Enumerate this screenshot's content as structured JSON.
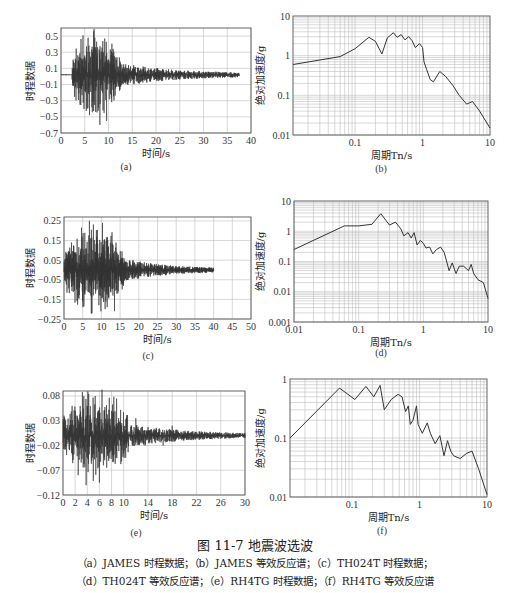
{
  "figure": {
    "title": "图 11-7   地震波选波",
    "caption_line1": "（a）JAMES 时程数据；（b）JAMES 等效反应谱；（c）TH024T 时程数据；",
    "caption_line2": "（d）TH024T 等效反应谱；（e）RH4TG 时程数据；（f）RH4TG 等效反应谱"
  },
  "chart_data": [
    {
      "id": "a",
      "panel_label": "(a)",
      "type": "line",
      "title": "JAMES 时程数据",
      "xlabel": "时间/s",
      "ylabel": "时程数据",
      "xlim": [
        0,
        40
      ],
      "ylim": [
        -0.7,
        0.6
      ],
      "xticks": [
        0,
        5,
        10,
        15,
        20,
        25,
        30,
        35,
        40
      ],
      "yticks": [
        0.5,
        0.3,
        0.1,
        -0.1,
        -0.3,
        -0.5,
        -0.7
      ],
      "grid": true,
      "signal": {
        "start": 2.3,
        "end": 37.5,
        "strong_end": 12.5,
        "peak_pos": 0.48,
        "peak_neg": -0.6,
        "baseline": 0.02
      },
      "series": [
        {
          "name": "JAMES",
          "x": [
            0,
            2.3,
            3,
            4,
            5,
            5.7,
            6.5,
            7.5,
            8.2,
            9.2,
            9.6,
            11,
            12.5,
            15.3,
            20,
            25,
            30,
            35,
            37.5
          ],
          "y": [
            0.02,
            0.02,
            0.22,
            -0.35,
            0.26,
            0.48,
            -0.38,
            0.43,
            -0.6,
            0.47,
            -0.55,
            0.25,
            0.16,
            0.14,
            0.06,
            0.05,
            0.05,
            0.03,
            0.02
          ]
        }
      ]
    },
    {
      "id": "b",
      "panel_label": "(b)",
      "type": "line",
      "title": "JAMES 等效反应谱",
      "xlabel": "周期Tn/s",
      "ylabel": "绝对加速度/g",
      "xscale": "log",
      "yscale": "log",
      "xlim": [
        0.012,
        10
      ],
      "ylim": [
        0.01,
        10
      ],
      "xticks": [
        0.1,
        1,
        10
      ],
      "yticks": [
        10,
        1,
        0.1,
        0.01
      ],
      "grid": true,
      "series": [
        {
          "name": "JAMES",
          "x": [
            0.012,
            0.06,
            0.1,
            0.16,
            0.2,
            0.25,
            0.3,
            0.37,
            0.42,
            0.48,
            0.55,
            0.62,
            0.7,
            0.78,
            0.9,
            1.0,
            1.05,
            1.15,
            1.3,
            1.45,
            1.8,
            2.2,
            2.8,
            3.5,
            4.5,
            5.5,
            7,
            10
          ],
          "y": [
            0.6,
            0.95,
            1.5,
            2.9,
            2.3,
            1.1,
            2.8,
            3.8,
            2.9,
            3.4,
            2.5,
            3.0,
            2.4,
            1.6,
            2.0,
            1.6,
            0.7,
            0.45,
            0.25,
            0.22,
            0.4,
            0.3,
            0.18,
            0.1,
            0.06,
            0.07,
            0.04,
            0.015
          ]
        }
      ]
    },
    {
      "id": "c",
      "panel_label": "(c)",
      "type": "line",
      "title": "TH024T 时程数据",
      "xlabel": "时间/s",
      "ylabel": "时程数据",
      "xlim": [
        0,
        50
      ],
      "ylim": [
        -0.25,
        0.27
      ],
      "xticks": [
        0,
        5,
        10,
        15,
        20,
        25,
        30,
        35,
        40,
        45,
        50
      ],
      "yticks": [
        0.25,
        0.15,
        0.05,
        -0.05,
        -0.15,
        -0.25
      ],
      "grid": true,
      "signal": {
        "start": 0,
        "end": 40,
        "strong_end": 16,
        "peak_pos": 0.25,
        "peak_neg": -0.22,
        "baseline": 0.0
      },
      "series": [
        {
          "name": "TH024T",
          "x": [
            0,
            2,
            4,
            6.8,
            7.5,
            10.3,
            11,
            13.5,
            15,
            18.5,
            20,
            25,
            30,
            35,
            40
          ],
          "y": [
            0.0,
            0.14,
            -0.12,
            0.25,
            -0.22,
            0.24,
            -0.2,
            -0.21,
            0.05,
            0.05,
            0.03,
            0.02,
            0.01,
            0.01,
            0.0
          ]
        }
      ]
    },
    {
      "id": "d",
      "panel_label": "(d)",
      "type": "line",
      "title": "TH024T 等效反应谱",
      "xlabel": "周期Tn/s",
      "ylabel": "绝对加速度/g",
      "xscale": "log",
      "yscale": "log",
      "xlim": [
        0.01,
        10
      ],
      "ylim": [
        0.001,
        10
      ],
      "xticks": [
        0.01,
        0.1,
        1,
        10
      ],
      "yticks": [
        10,
        1,
        0.1,
        0.01,
        0.001
      ],
      "grid": true,
      "series": [
        {
          "name": "TH024T",
          "x": [
            0.01,
            0.06,
            0.1,
            0.16,
            0.22,
            0.3,
            0.37,
            0.45,
            0.5,
            0.58,
            0.65,
            0.72,
            0.8,
            0.9,
            1.0,
            1.1,
            1.25,
            1.4,
            1.6,
            1.85,
            2.1,
            2.5,
            2.8,
            3.2,
            3.6,
            4.2,
            5.0,
            5.5,
            6.0,
            7,
            8.5,
            10
          ],
          "y": [
            0.25,
            1.5,
            1.5,
            1.7,
            3.8,
            1.6,
            2.0,
            1.2,
            0.7,
            0.9,
            0.6,
            0.9,
            0.35,
            0.5,
            0.4,
            0.28,
            0.3,
            0.18,
            0.25,
            0.3,
            0.2,
            0.05,
            0.09,
            0.04,
            0.07,
            0.07,
            0.05,
            0.08,
            0.04,
            0.025,
            0.02,
            0.006
          ]
        }
      ]
    },
    {
      "id": "e",
      "panel_label": "(e)",
      "type": "line",
      "title": "RH4TG 时程数据",
      "xlabel": "时间/s",
      "ylabel": "时程数据",
      "xlim": [
        0,
        30
      ],
      "ylim": [
        -0.12,
        0.09
      ],
      "xticks": [
        0,
        2,
        4,
        6,
        8,
        10,
        14,
        18,
        22,
        26,
        30
      ],
      "yticks": [
        0.08,
        0.03,
        -0.02,
        -0.07,
        -0.12
      ],
      "grid": true,
      "signal": {
        "start": 0,
        "end": 30,
        "strong_end": 11,
        "peak_pos": 0.088,
        "peak_neg": -0.1,
        "baseline": 0.0
      },
      "series": [
        {
          "name": "RH4TG",
          "x": [
            0,
            1.5,
            2.5,
            3.2,
            3.8,
            5.3,
            6,
            8,
            10,
            12,
            13.5,
            16.5,
            18,
            20,
            22,
            26,
            30
          ],
          "y": [
            0.0,
            0.06,
            -0.08,
            0.088,
            -0.1,
            0.08,
            -0.095,
            0.05,
            0.02,
            0.035,
            -0.02,
            -0.02,
            0.02,
            0.0,
            0.0,
            0.0,
            0.0
          ]
        }
      ]
    },
    {
      "id": "f",
      "panel_label": "(f)",
      "type": "line",
      "title": "RH4TG 等效反应谱",
      "xlabel": "周期Tn/s",
      "ylabel": "绝对加速度/g",
      "xscale": "log",
      "yscale": "log",
      "xlim": [
        0.012,
        10
      ],
      "ylim": [
        0.01,
        1
      ],
      "xticks": [
        0.1,
        1,
        10
      ],
      "yticks": [
        1,
        0.1,
        0.01
      ],
      "grid": true,
      "series": [
        {
          "name": "RH4TG",
          "x": [
            0.012,
            0.065,
            0.11,
            0.16,
            0.21,
            0.26,
            0.3,
            0.38,
            0.48,
            0.55,
            0.62,
            0.68,
            0.73,
            0.8,
            0.9,
            0.95,
            1.1,
            1.3,
            1.45,
            1.7,
            2.0,
            2.3,
            2.6,
            2.9,
            3.2,
            4.0,
            5.0,
            6.0,
            7.5,
            10
          ],
          "y": [
            0.1,
            0.7,
            0.45,
            0.75,
            0.5,
            0.78,
            0.3,
            0.45,
            0.55,
            0.5,
            0.28,
            0.35,
            0.17,
            0.2,
            0.35,
            0.17,
            0.12,
            0.18,
            0.12,
            0.08,
            0.11,
            0.05,
            0.09,
            0.06,
            0.05,
            0.045,
            0.055,
            0.06,
            0.03,
            0.011
          ]
        }
      ]
    }
  ]
}
